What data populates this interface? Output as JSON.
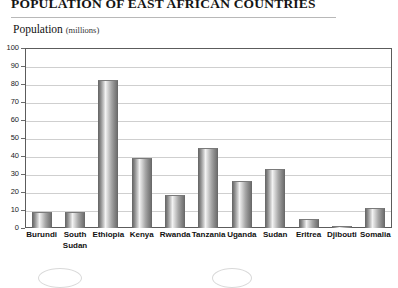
{
  "title": "POPULATION OF EAST AFRICAN COUNTRIES",
  "axis_caption": {
    "name": "Population",
    "unit": "(millions)"
  },
  "chart_data": {
    "type": "bar",
    "title": "POPULATION OF EAST AFRICAN COUNTRIES",
    "xlabel": "",
    "ylabel": "Population (millions)",
    "ylim": [
      0,
      100
    ],
    "ytick_step": 10,
    "ytick_labels": [
      "100",
      "90",
      "80",
      "70",
      "60",
      "50",
      "40",
      "30",
      "20",
      "10",
      "0"
    ],
    "grid": true,
    "legend": "none",
    "categories": [
      "Burundi",
      "South Sudan",
      "Ethiopia",
      "Kenya",
      "Rwanda",
      "Tanzania",
      "Uganda",
      "Sudan",
      "Eritrea",
      "Djibouti",
      "Somalia"
    ],
    "values": [
      9,
      9,
      82,
      39,
      18.5,
      44.5,
      26,
      33,
      5,
      1,
      11
    ],
    "bar_color": "#a8a8a8",
    "bar_style": "cylinder-gradient"
  }
}
